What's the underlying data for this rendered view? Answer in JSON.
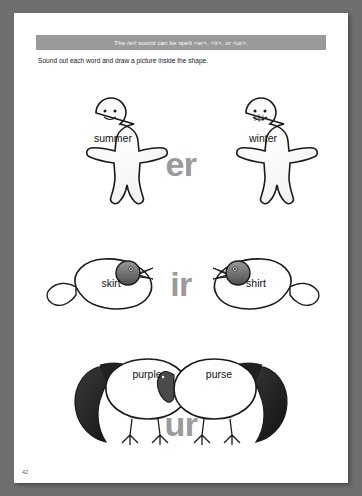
{
  "page": {
    "banner_text": "The /er/ sound can be spelt <er>, <ir>, or <ur>.",
    "instructions": "Sound out each word and draw a picture inside the shape.",
    "page_number": "42"
  },
  "rows": [
    {
      "id": "row-er",
      "left_word": "summer",
      "right_word": "winter",
      "center_letters": "er",
      "shape": "gingerbread-man"
    },
    {
      "id": "row-ir",
      "left_word": "skirt",
      "right_word": "shirt",
      "center_letters": "ir",
      "shape": "bird"
    },
    {
      "id": "row-ur",
      "left_word": "purple",
      "right_word": "purse",
      "center_letters": "ur",
      "shape": "turkey"
    }
  ],
  "colors": {
    "banner_bg": "#9a9a9a",
    "big_letter": "#9b9b9b",
    "page_bg": "#ffffff",
    "backdrop": "#6f6f6f",
    "outline": "#1a1a1a"
  }
}
